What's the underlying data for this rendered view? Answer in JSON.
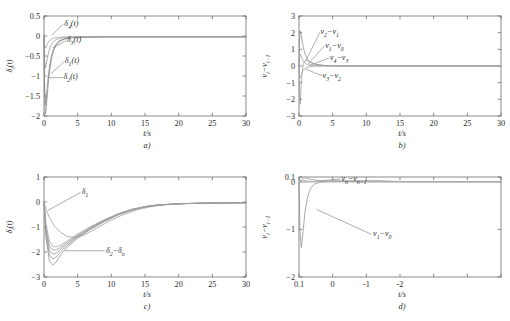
{
  "figure": {
    "panel_count": 4,
    "shared_xlabel": "t/s",
    "background": "#ffffff",
    "axis_color": "#5a5a5a"
  },
  "chart_data": [
    {
      "type": "line",
      "panel": "a",
      "caption": "a)",
      "title": "",
      "xlabel": "t/s",
      "ylabel": "δi(t)",
      "xlim": [
        0,
        30
      ],
      "ylim": [
        -2,
        0.5
      ],
      "xticks": [
        0,
        5,
        10,
        15,
        20,
        25,
        30
      ],
      "yticks": [
        0.5,
        0,
        -0.5,
        -1,
        -1.5,
        -2
      ],
      "xtick_labels": [
        "0",
        "5",
        "10",
        "15",
        "20",
        "25",
        "30"
      ],
      "ytick_labels": [
        "0.5",
        "0",
        "-0.5",
        "-1",
        "-1.5",
        "-2"
      ],
      "grid": false,
      "legend": "none",
      "annotations": [
        {
          "text": "δ4(t)",
          "x": 3.0,
          "y": 0.3
        },
        {
          "text": "δ3(t)",
          "x": 3.4,
          "y": -0.1
        },
        {
          "text": "δ1(t)",
          "x": 3.1,
          "y": -0.62
        },
        {
          "text": "δ2(t)",
          "x": 2.9,
          "y": -1.02
        }
      ],
      "series": [
        {
          "name": "δ1(t)",
          "color": "#7d7d7d",
          "x": [
            0,
            0.1,
            0.22,
            0.35,
            0.5,
            0.7,
            0.9,
            1.1,
            1.4,
            1.8,
            2.3,
            3.0,
            4.0,
            5.5,
            7.5,
            10,
            14,
            18,
            24,
            30
          ],
          "y": [
            0,
            -1.3,
            -1.72,
            -1.55,
            -1.25,
            -0.92,
            -0.68,
            -0.5,
            -0.33,
            -0.2,
            -0.12,
            -0.07,
            -0.04,
            -0.03,
            -0.025,
            -0.02,
            -0.02,
            -0.02,
            -0.02,
            -0.02
          ]
        },
        {
          "name": "δ2(t)",
          "color": "#8a8a8a",
          "x": [
            0,
            0.1,
            0.22,
            0.35,
            0.5,
            0.7,
            0.9,
            1.1,
            1.4,
            1.8,
            2.3,
            3.0,
            4.0,
            5.5,
            7.5,
            10,
            14,
            18,
            24,
            30
          ],
          "y": [
            0,
            -1.55,
            -1.95,
            -1.78,
            -1.45,
            -1.08,
            -0.8,
            -0.58,
            -0.38,
            -0.23,
            -0.14,
            -0.08,
            -0.045,
            -0.03,
            -0.025,
            -0.02,
            -0.02,
            -0.02,
            -0.02,
            -0.02
          ]
        },
        {
          "name": "δ3(t)",
          "color": "#959595",
          "x": [
            0,
            0.1,
            0.22,
            0.35,
            0.5,
            0.7,
            0.9,
            1.1,
            1.4,
            1.8,
            2.3,
            3.0,
            4.0,
            5.5,
            7.5,
            10,
            14,
            18,
            24,
            30
          ],
          "y": [
            0,
            -0.62,
            -0.8,
            -0.7,
            -0.55,
            -0.4,
            -0.29,
            -0.21,
            -0.14,
            -0.09,
            -0.06,
            -0.04,
            -0.03,
            -0.025,
            -0.02,
            -0.02,
            -0.02,
            -0.02,
            -0.02,
            -0.02
          ]
        },
        {
          "name": "δ4(t)",
          "color": "#a0a0a0",
          "x": [
            0,
            0.1,
            0.22,
            0.35,
            0.5,
            0.7,
            0.9,
            1.1,
            1.4,
            1.8,
            2.3,
            3.0,
            4.0,
            5.5,
            7.5,
            10,
            14,
            18,
            24,
            30
          ],
          "y": [
            0,
            -0.22,
            -0.3,
            -0.26,
            -0.2,
            -0.14,
            -0.1,
            -0.075,
            -0.055,
            -0.04,
            -0.03,
            -0.025,
            -0.022,
            -0.02,
            -0.02,
            -0.02,
            -0.02,
            -0.02,
            -0.02,
            -0.02
          ]
        }
      ]
    },
    {
      "type": "line",
      "panel": "b",
      "caption": "b)",
      "title": "",
      "xlabel": "t/s",
      "ylabel": "vi-vi-1",
      "xlim": [
        0,
        30
      ],
      "ylim": [
        -3,
        3
      ],
      "xticks": [
        0,
        5,
        10,
        15,
        20,
        25,
        30
      ],
      "yticks": [
        3,
        2,
        1,
        0,
        -1,
        -2,
        -3
      ],
      "xtick_labels": [
        "0",
        "5",
        "10",
        "15",
        "20",
        "25",
        "30"
      ],
      "ytick_labels": [
        "3",
        "2",
        "1",
        "0",
        "-1",
        "-2",
        "-3"
      ],
      "grid": false,
      "legend": "none",
      "annotations": [
        {
          "text": "v2-v1",
          "x": 3.2,
          "y": 2.05
        },
        {
          "text": "v1-v0",
          "x": 3.9,
          "y": 1.25
        },
        {
          "text": "v4-v3",
          "x": 4.6,
          "y": 0.52
        },
        {
          "text": "v3-v2",
          "x": 3.5,
          "y": -0.55
        }
      ],
      "series": [
        {
          "name": "v2-v1",
          "color": "#8a8a8a",
          "x": [
            0,
            0.08,
            0.18,
            0.3,
            0.45,
            0.65,
            0.9,
            1.2,
            1.6,
            2.1,
            2.8,
            3.8,
            5.0,
            7.0,
            10,
            14,
            20,
            30
          ],
          "y": [
            0,
            1.55,
            2.12,
            1.95,
            1.55,
            1.1,
            0.72,
            0.45,
            0.26,
            0.14,
            0.07,
            0.03,
            0.01,
            0.0,
            0.0,
            0.0,
            0.0,
            0.0
          ]
        },
        {
          "name": "v1-v0",
          "color": "#949494",
          "x": [
            0,
            0.08,
            0.18,
            0.3,
            0.45,
            0.65,
            0.9,
            1.2,
            1.6,
            2.1,
            2.8,
            3.8,
            5.0,
            7.0,
            10,
            14,
            20,
            30
          ],
          "y": [
            0,
            -1.7,
            -2.3,
            -1.3,
            -0.45,
            0.12,
            0.32,
            0.33,
            0.25,
            0.16,
            0.08,
            0.035,
            0.015,
            0.0,
            0.0,
            0.0,
            0.0,
            0.0
          ]
        },
        {
          "name": "v4-v3",
          "color": "#9e9e9e",
          "x": [
            0,
            0.08,
            0.18,
            0.3,
            0.45,
            0.65,
            0.9,
            1.2,
            1.6,
            2.1,
            2.8,
            3.8,
            5.0,
            7.0,
            10,
            14,
            20,
            30
          ],
          "y": [
            0,
            0.52,
            0.72,
            0.62,
            0.46,
            0.3,
            0.18,
            0.1,
            0.05,
            0.025,
            0.012,
            0.005,
            0.0,
            0.0,
            0.0,
            0.0,
            0.0,
            0.0
          ]
        },
        {
          "name": "v3-v2",
          "color": "#a8a8a8",
          "x": [
            0,
            0.08,
            0.18,
            0.3,
            0.45,
            0.65,
            0.9,
            1.2,
            1.6,
            2.1,
            2.8,
            3.8,
            5.0,
            7.0,
            10,
            14,
            20,
            30
          ],
          "y": [
            0,
            -0.55,
            -0.72,
            -0.58,
            -0.4,
            -0.25,
            -0.14,
            -0.075,
            -0.04,
            -0.02,
            -0.01,
            -0.005,
            0.0,
            0.0,
            0.0,
            0.0,
            0.0,
            0.0
          ]
        }
      ]
    },
    {
      "type": "line",
      "panel": "c",
      "caption": "c)",
      "title": "",
      "xlabel": "t/s",
      "ylabel": "δi(t)",
      "xlim": [
        0,
        30
      ],
      "ylim": [
        -3,
        1
      ],
      "xticks": [
        0,
        5,
        10,
        15,
        20,
        25,
        30
      ],
      "yticks": [
        1,
        0,
        -1,
        -2,
        -3
      ],
      "xtick_labels": [
        "0",
        "5",
        "10",
        "15",
        "20",
        "25",
        "30"
      ],
      "ytick_labels": [
        "1",
        "0",
        "-1",
        "-2",
        "-3"
      ],
      "grid": false,
      "legend": "none",
      "annotations": [
        {
          "text": "δ1",
          "x": 5.6,
          "y": 0.42
        },
        {
          "text": "δ2-δn",
          "x": 9.2,
          "y": -1.93
        }
      ],
      "series": [
        {
          "name": "δ1",
          "color": "#9a9a9a",
          "x": [
            0,
            0.3,
            0.8,
            1.5,
            2.5,
            3.5,
            4.5,
            6,
            8,
            10,
            12,
            14,
            16,
            18,
            21,
            24,
            27,
            30
          ],
          "y": [
            0,
            -0.3,
            -0.62,
            -0.95,
            -1.22,
            -1.38,
            -1.42,
            -1.32,
            -1.02,
            -0.72,
            -0.48,
            -0.3,
            -0.18,
            -0.11,
            -0.06,
            -0.04,
            -0.03,
            -0.03
          ]
        },
        {
          "name": "δ2",
          "color": "#8d8d8d",
          "x": [
            0,
            0.3,
            0.8,
            1.3,
            1.8,
            2.5,
            3.5,
            5,
            7,
            9,
            11,
            13,
            15,
            17,
            20,
            23,
            26,
            30
          ],
          "y": [
            0,
            -1.45,
            -2.35,
            -2.52,
            -2.4,
            -2.1,
            -1.8,
            -1.45,
            -1.08,
            -0.78,
            -0.52,
            -0.33,
            -0.2,
            -0.13,
            -0.07,
            -0.05,
            -0.04,
            -0.03
          ]
        },
        {
          "name": "δ3",
          "color": "#8d8d8d",
          "x": [
            0,
            0.3,
            0.8,
            1.3,
            1.8,
            2.5,
            3.5,
            5,
            7,
            9,
            11,
            13,
            15,
            17,
            20,
            23,
            26,
            30
          ],
          "y": [
            0,
            -1.3,
            -2.12,
            -2.28,
            -2.2,
            -1.98,
            -1.72,
            -1.4,
            -1.05,
            -0.76,
            -0.5,
            -0.32,
            -0.19,
            -0.12,
            -0.07,
            -0.05,
            -0.04,
            -0.03
          ]
        },
        {
          "name": "δ4",
          "color": "#939393",
          "x": [
            0,
            0.3,
            0.8,
            1.3,
            1.8,
            2.5,
            3.5,
            5,
            7,
            9,
            11,
            13,
            15,
            17,
            20,
            23,
            26,
            30
          ],
          "y": [
            0,
            -1.15,
            -1.92,
            -2.08,
            -2.05,
            -1.88,
            -1.66,
            -1.36,
            -1.02,
            -0.74,
            -0.49,
            -0.31,
            -0.19,
            -0.12,
            -0.07,
            -0.05,
            -0.04,
            -0.03
          ]
        },
        {
          "name": "δ5",
          "color": "#999999",
          "x": [
            0,
            0.3,
            0.8,
            1.3,
            1.8,
            2.5,
            3.5,
            5,
            7,
            9,
            11,
            13,
            15,
            17,
            20,
            23,
            26,
            30
          ],
          "y": [
            0,
            -1.02,
            -1.75,
            -1.92,
            -1.92,
            -1.8,
            -1.6,
            -1.32,
            -1.0,
            -0.72,
            -0.48,
            -0.3,
            -0.18,
            -0.11,
            -0.07,
            -0.05,
            -0.04,
            -0.03
          ]
        },
        {
          "name": "δn",
          "color": "#a3a3a3",
          "x": [
            0,
            0.3,
            0.8,
            1.3,
            1.8,
            2.5,
            3.5,
            5,
            7,
            9,
            11,
            13,
            15,
            17,
            20,
            23,
            26,
            30
          ],
          "y": [
            0,
            -0.88,
            -1.55,
            -1.78,
            -1.8,
            -1.72,
            -1.55,
            -1.28,
            -0.97,
            -0.7,
            -0.47,
            -0.29,
            -0.18,
            -0.11,
            -0.07,
            -0.05,
            -0.04,
            -0.03
          ]
        }
      ]
    },
    {
      "type": "line",
      "panel": "d",
      "caption": "d)",
      "title": "",
      "xlabel": "t/s",
      "ylabel": "vi-vi-1",
      "xlim": [
        0,
        30
      ],
      "ylim": [
        -2,
        0.1
      ],
      "xticks": [
        0,
        5,
        10,
        15,
        20,
        25,
        30
      ],
      "yticks": [
        0.1,
        0,
        -1,
        -2
      ],
      "xtick_labels": [
        "0.1",
        "0",
        "-1",
        "-2"
      ],
      "ytick_labels": [
        "0.1",
        "0",
        "-1",
        "-2"
      ],
      "grid": false,
      "legend": "none",
      "annotations": [
        {
          "text": "vn-vn-1",
          "x": 6.3,
          "y": 0.062
        },
        {
          "text": "v1-v0",
          "x": 11.0,
          "y": -1.08
        }
      ],
      "series": [
        {
          "name": "v1-v0",
          "color": "#8d8d8d",
          "x": [
            0,
            0.15,
            0.35,
            0.6,
            0.9,
            1.3,
            1.8,
            2.4,
            3.2,
            4.2,
            5.5,
            7,
            9,
            11,
            14,
            17,
            21,
            25,
            30
          ],
          "y": [
            0,
            -1.05,
            -1.38,
            -1.05,
            -0.62,
            -0.3,
            -0.12,
            -0.04,
            -0.01,
            0.0,
            0.0,
            0.0,
            0.0,
            0.0,
            0.0,
            0.0,
            0.0,
            0.0,
            0.0
          ]
        },
        {
          "name": "vn-vn-1",
          "color": "#969696",
          "x": [
            0,
            0.2,
            0.5,
            0.8,
            1.1,
            1.5,
            2.0,
            2.6,
            3.4,
            4.4,
            5.6,
            7,
            8.5,
            10,
            11.5,
            13,
            15,
            17,
            20,
            24,
            30
          ],
          "y": [
            0,
            0.03,
            0.062,
            0.078,
            0.075,
            0.062,
            0.046,
            0.032,
            0.02,
            0.012,
            0.007,
            0.004,
            0.002,
            0.001,
            0.001,
            0.0,
            0.0,
            0.0,
            0.0,
            0.0,
            0.0
          ]
        },
        {
          "name": "v2-v1",
          "color": "#a0a0a0",
          "x": [
            0,
            0.2,
            0.5,
            0.9,
            1.4,
            2.0,
            2.8,
            3.8,
            5,
            6.5,
            8,
            9.5,
            11,
            12.5,
            14,
            15.5,
            17,
            20,
            24,
            30
          ],
          "y": [
            0,
            0.018,
            0.028,
            0.022,
            0.014,
            0.009,
            0.012,
            0.018,
            0.022,
            0.024,
            0.022,
            0.026,
            0.03,
            0.022,
            0.012,
            0.004,
            0.001,
            0.0,
            0.0,
            0.0
          ]
        },
        {
          "name": "v3-v2",
          "color": "#aaaaaa",
          "x": [
            0,
            0.2,
            0.5,
            0.9,
            1.4,
            2.0,
            2.8,
            3.8,
            5,
            6.5,
            8,
            9.5,
            11,
            12.5,
            14,
            15.5,
            17,
            20,
            24,
            30
          ],
          "y": [
            0,
            -0.012,
            -0.018,
            -0.012,
            -0.006,
            -0.002,
            0.002,
            0.006,
            0.01,
            0.012,
            0.011,
            0.009,
            0.006,
            0.004,
            0.002,
            0.001,
            0.0,
            0.0,
            0.0,
            0.0
          ]
        },
        {
          "name": "v4-v3",
          "color": "#b0b0b0",
          "x": [
            0,
            0.2,
            0.5,
            0.9,
            1.4,
            2.0,
            2.8,
            3.8,
            5,
            6.5,
            8,
            10,
            12,
            14,
            16,
            20,
            24,
            30
          ],
          "y": [
            0,
            0.01,
            0.016,
            0.01,
            0.004,
            0.001,
            0.0,
            0.0,
            0.0,
            0.0,
            0.0,
            0.0,
            0.0,
            0.0,
            0.0,
            0.0,
            0.0,
            0.0
          ]
        }
      ]
    }
  ]
}
